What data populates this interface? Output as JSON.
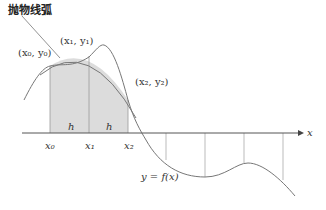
{
  "diagram": {
    "title": "抛物线弧",
    "axis_label": "x",
    "point_labels": {
      "p0": "(x₀, y₀)",
      "p1": "(x₁, y₁)",
      "p2": "(x₂, y₂)"
    },
    "tick_labels": {
      "x0": "x₀",
      "x1": "x₁",
      "x2": "x₂"
    },
    "interval_labels": [
      "h",
      "h"
    ],
    "function_label": "y = f(x)",
    "colors": {
      "shade": "#dcdcdc",
      "curve": "#777777",
      "axis": "#555555",
      "grid": "#999999"
    }
  }
}
